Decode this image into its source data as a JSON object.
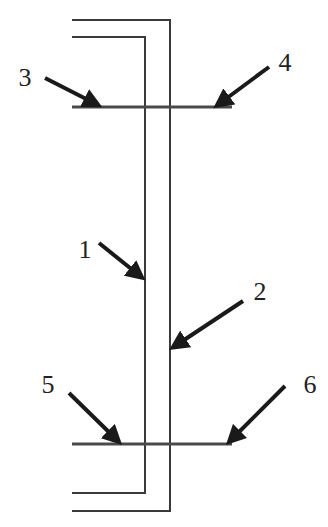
{
  "diagram": {
    "type": "schematic",
    "colors": {
      "line": "#3a3a3a",
      "arrow": "#1a1a1a",
      "background": "#ffffff"
    },
    "labels": [
      {
        "id": "1",
        "text": "1",
        "x": 85,
        "y": 250
      },
      {
        "id": "2",
        "text": "2",
        "x": 260,
        "y": 292
      },
      {
        "id": "3",
        "text": "3",
        "x": 25,
        "y": 78
      },
      {
        "id": "4",
        "text": "4",
        "x": 285,
        "y": 63
      },
      {
        "id": "5",
        "text": "5",
        "x": 48,
        "y": 385
      },
      {
        "id": "6",
        "text": "6",
        "x": 310,
        "y": 385
      }
    ],
    "components": [
      {
        "id": "1",
        "name": "inner-vertical-line",
        "x": 145,
        "y1": 37,
        "y2": 493
      },
      {
        "id": "2",
        "name": "outer-vertical-line",
        "x": 170,
        "y1": 20,
        "y2": 511
      },
      {
        "id": "3",
        "name": "top-bar-left",
        "y": 107,
        "x1": 72,
        "x2": 145
      },
      {
        "id": "4",
        "name": "top-bar-right",
        "y": 107,
        "x1": 170,
        "x2": 232
      },
      {
        "id": "5",
        "name": "bottom-bar-left",
        "y": 444,
        "x1": 72,
        "x2": 145
      },
      {
        "id": "6",
        "name": "bottom-bar-right",
        "y": 444,
        "x1": 170,
        "x2": 232
      }
    ]
  }
}
